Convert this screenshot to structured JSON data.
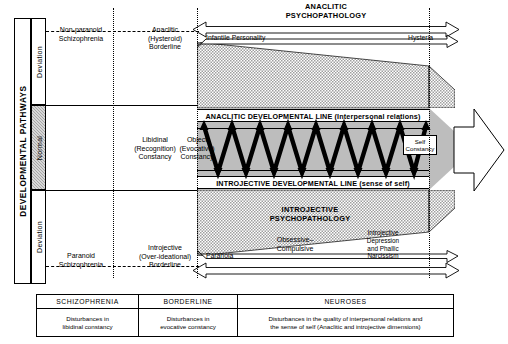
{
  "axis": {
    "pathways_label": "DEVELOPMENTAL  PATHWAYS",
    "bands": [
      {
        "label": "Deviation"
      },
      {
        "label": "Normal"
      },
      {
        "label": "Deviation"
      }
    ]
  },
  "columns": {
    "upper": [
      {
        "label": "Non-paranoid\nSchizophrenia"
      },
      {
        "label": "Anaclitic\n(Hysteroid)\nBorderline"
      }
    ],
    "middle": [
      {
        "label": "Libidinal\n(Recognition)\nConstancy"
      },
      {
        "label": "Object\n(Evocative)\nConstancy"
      },
      {
        "label": "Self\nConstancy"
      }
    ],
    "lower": [
      {
        "label": "Paranoid\nSchizophrenia"
      },
      {
        "label": "Introjective\n(Over-ideational)\nBorderline"
      }
    ]
  },
  "regions": {
    "anaclitic_psychopathology": "ANACLITIC\nPSYCHOPATHOLOGY",
    "introjective_psychopathology": "INTROJECTIVE\nPSYCHOPATHOLOGY",
    "anaclitic_line": "ANACLITIC DEVELOPMENTAL LINE (Interpersonal relations)",
    "introjective_line": "INTROJECTIVE DEVELOPMENTAL LINE (sense of self)"
  },
  "markers": {
    "infantile_personality": "Infantile Personality",
    "hysteria": "Hysteria",
    "paranoia": "Paranoia",
    "obsessive_compulsive": "Obsessive–\nCompulsive",
    "introjective_depression": "Introjective\nDepression\nand Phallic\nNarcissism"
  },
  "legend": {
    "columns": [
      {
        "header": "SCHIZOPHRENIA",
        "body": "Disturbances in\nlibidinal constancy"
      },
      {
        "header": "BORDERLINE",
        "body": "Disturbances in\nevocative constancy"
      },
      {
        "header": "NEUROSES",
        "body": "Disturbances in the quality of interpersonal relations and\nthe sense of self (Anaclitic and introjective dimensions)"
      }
    ]
  },
  "colors": {
    "ink": "#000000",
    "hatch": "#c9c9c9",
    "band_grey": "#bdbdbd",
    "normal_band": "#a6a6a6",
    "paper": "#ffffff"
  }
}
